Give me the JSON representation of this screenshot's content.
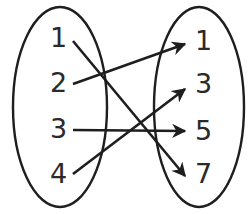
{
  "diagram": {
    "type": "mapping-diagram",
    "domain": {
      "name": "left-set",
      "elements": [
        "1",
        "2",
        "3",
        "4"
      ]
    },
    "range": {
      "name": "right-set",
      "elements": [
        "1",
        "3",
        "5",
        "7"
      ]
    },
    "mappings": [
      {
        "from": "1",
        "to": "7"
      },
      {
        "from": "2",
        "to": "1"
      },
      {
        "from": "3",
        "to": "5"
      },
      {
        "from": "4",
        "to": "3"
      }
    ],
    "colors": {
      "stroke": "#1e1e1e",
      "text": "#2a2a2a",
      "background": "#ffffff"
    }
  }
}
